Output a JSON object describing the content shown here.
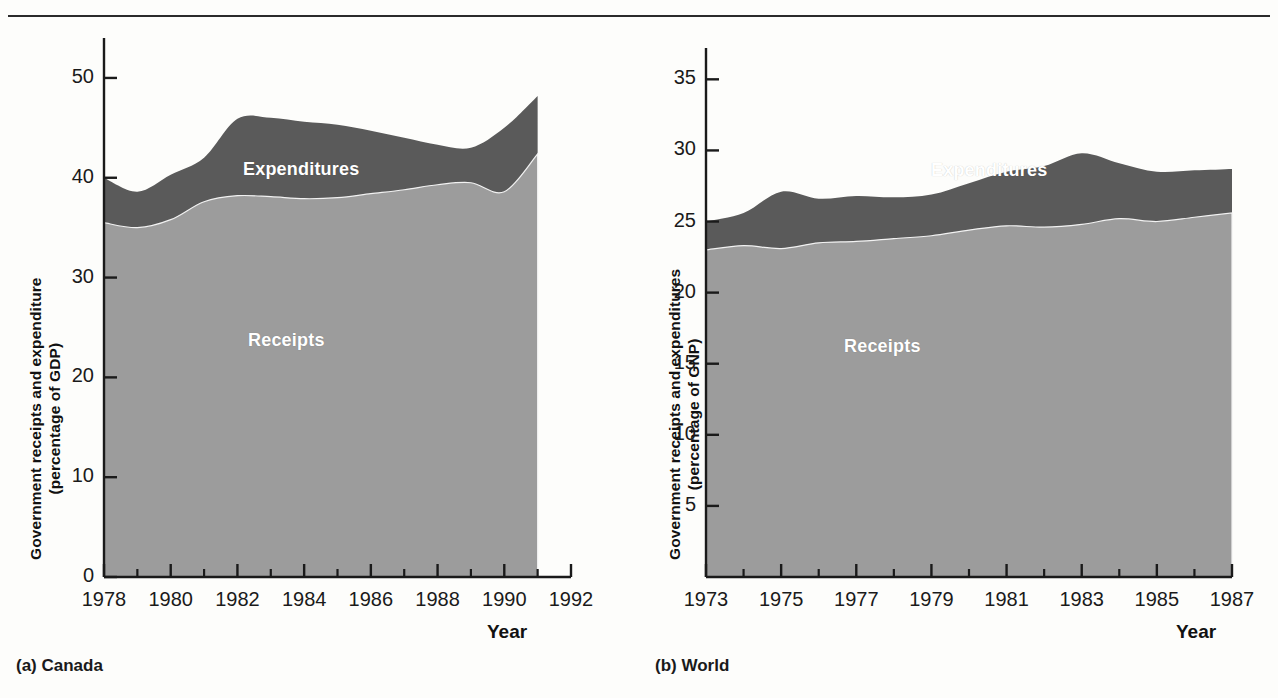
{
  "page": {
    "background_color": "#fdfdfb",
    "rule_color": "#2b2b2b"
  },
  "colors": {
    "receipts_fill": "#9c9c9c",
    "expenditures_fill": "#5a5a5a",
    "axis": "#1a1a1a",
    "series_label_text": "#ffffff"
  },
  "panel_a": {
    "caption": "(a) Canada",
    "ylabel_line1": "Government receipts and expenditure",
    "ylabel_line2": "(percentage of GDP)",
    "xaxis_title": "Year",
    "series_label_expenditures": "Expenditures",
    "series_label_receipts": "Receipts",
    "ytick_labels": [
      "50",
      "40",
      "30",
      "20",
      "10",
      "0"
    ],
    "xtick_labels": [
      "1978",
      "1980",
      "1982",
      "1984",
      "1986",
      "1988",
      "1990",
      "1992"
    ]
  },
  "panel_b": {
    "caption": "(b) World",
    "ylabel_line1": "Government receipts and expenditures",
    "ylabel_line2": "(percentage of GNP)",
    "xaxis_title": "Year",
    "series_label_expenditures": "Expenditures",
    "series_label_receipts": "Receipts",
    "ytick_labels": [
      "35",
      "30",
      "25",
      "20",
      "15",
      "10",
      "5"
    ],
    "xtick_labels": [
      "1973",
      "1975",
      "1977",
      "1979",
      "1981",
      "1983",
      "1985",
      "1987"
    ]
  },
  "chart_data": [
    {
      "id": "canada",
      "type": "area",
      "title": "(a) Canada",
      "xlabel": "Year",
      "ylabel": "Government receipts and expenditure (percentage of GDP)",
      "xlim": [
        1978,
        1992
      ],
      "ylim": [
        0,
        53
      ],
      "yticks": [
        0,
        10,
        20,
        30,
        40,
        50
      ],
      "xticks": [
        1978,
        1980,
        1982,
        1984,
        1986,
        1988,
        1990,
        1992
      ],
      "minor_xticks": [
        1979,
        1981,
        1983,
        1985,
        1987,
        1989,
        1991
      ],
      "grid": false,
      "legend": "inline-labels",
      "stacked": false,
      "x": [
        1978,
        1979,
        1980,
        1981,
        1982,
        1983,
        1984,
        1985,
        1986,
        1987,
        1988,
        1989,
        1990,
        1991
      ],
      "series": [
        {
          "name": "Expenditures",
          "color": "#5a5a5a",
          "values": [
            40.0,
            38.6,
            40.3,
            42.0,
            45.9,
            46.0,
            45.6,
            45.3,
            44.7,
            44.0,
            43.3,
            43.0,
            45.0,
            48.2
          ]
        },
        {
          "name": "Receipts",
          "color": "#9c9c9c",
          "values": [
            35.5,
            35.0,
            35.8,
            37.6,
            38.2,
            38.1,
            37.9,
            38.0,
            38.4,
            38.8,
            39.3,
            39.5,
            38.6,
            42.4
          ]
        }
      ]
    },
    {
      "id": "world",
      "type": "area",
      "title": "(b) World",
      "xlabel": "Year",
      "ylabel": "Government receipts and expenditures (percentage of GNP)",
      "xlim": [
        1973,
        1987
      ],
      "ylim": [
        0,
        36.5
      ],
      "yticks": [
        5,
        10,
        15,
        20,
        25,
        30,
        35
      ],
      "xticks": [
        1973,
        1975,
        1977,
        1979,
        1981,
        1983,
        1985,
        1987
      ],
      "minor_xticks": [
        1974,
        1976,
        1978,
        1980,
        1982,
        1984,
        1986
      ],
      "grid": false,
      "legend": "inline-labels",
      "stacked": false,
      "x": [
        1973,
        1974,
        1975,
        1976,
        1977,
        1978,
        1979,
        1980,
        1981,
        1982,
        1983,
        1984,
        1985,
        1986,
        1987
      ],
      "series": [
        {
          "name": "Expenditures",
          "color": "#5a5a5a",
          "values": [
            25.0,
            25.6,
            27.1,
            26.6,
            26.8,
            26.7,
            26.9,
            27.7,
            28.5,
            28.9,
            29.8,
            29.1,
            28.5,
            28.6,
            28.7
          ]
        },
        {
          "name": "Receipts",
          "color": "#9c9c9c",
          "values": [
            23.0,
            23.3,
            23.1,
            23.5,
            23.6,
            23.8,
            24.0,
            24.4,
            24.7,
            24.6,
            24.8,
            25.2,
            25.0,
            25.3,
            25.6
          ]
        }
      ]
    }
  ]
}
